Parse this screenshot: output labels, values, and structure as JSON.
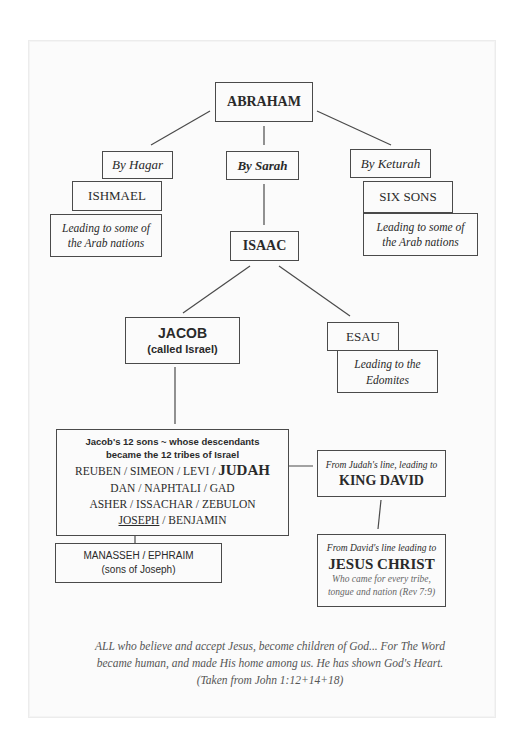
{
  "diagram": {
    "root": {
      "label": "ABRAHAM"
    },
    "branches": [
      {
        "via": "By Hagar",
        "name": "ISHMAEL",
        "note": [
          "Leading to some of",
          "the Arab nations"
        ]
      },
      {
        "via": "By Sarah",
        "name": "ISAAC"
      },
      {
        "via": "By Keturah",
        "name": "SIX SONS",
        "note": [
          "Leading to some of",
          "the Arab nations"
        ]
      }
    ],
    "isaac_children": {
      "jacob": {
        "name": "JACOB",
        "alias": "(called Israel)"
      },
      "esau": {
        "name": "ESAU",
        "note": [
          "Leading to the",
          "Edomites"
        ]
      }
    },
    "tribes": {
      "heading": [
        "Jacob's 12 sons ~ whose descendants",
        "became the 12 tribes of Israel"
      ],
      "row1": "REUBEN / SIMEON / LEVI / ",
      "row1_emph": "JUDAH",
      "row2": "DAN / NAPHTALI / GAD",
      "row3": "ASHER / ISSACHAR / ZEBULON",
      "row4_underlined": "JOSEPH",
      "row4_rest": " / BENJAMIN"
    },
    "joseph_sons": {
      "names": "MANASSEH / EPHRAIM",
      "note": "(sons of Joseph)"
    },
    "king_david": {
      "intro": "From Judah's line, leading to",
      "name": "KING DAVID"
    },
    "jesus": {
      "intro": "From David's line leading to",
      "name": "JESUS CHRIST",
      "note": [
        "Who came for every tribe,",
        "tongue and nation (Rev 7:9)"
      ]
    },
    "caption": [
      "ALL who believe and accept Jesus, become children of God... For The Word",
      "became human, and made His home among us. He has shown God's Heart.",
      "(Taken from John 1:12+14+18)"
    ]
  }
}
